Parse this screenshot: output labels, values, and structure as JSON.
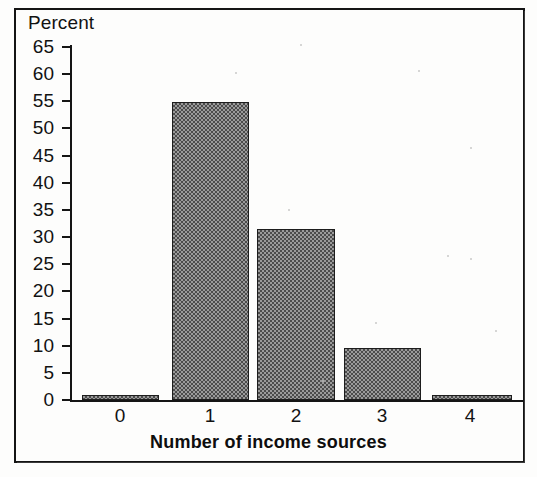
{
  "chart_data": {
    "type": "bar",
    "title": "",
    "xlabel": "Number of income sources",
    "ylabel": "Percent",
    "categories": [
      "0",
      "1",
      "2",
      "3",
      "4"
    ],
    "values": [
      1,
      54.9,
      31.4,
      9.6,
      0.7
    ],
    "ylim": [
      0,
      65
    ],
    "ytick_labels": [
      "0",
      "5",
      "10",
      "15",
      "20",
      "25",
      "30",
      "35",
      "40",
      "45",
      "50",
      "55",
      "60",
      "65"
    ],
    "ytick_values": [
      0,
      5,
      10,
      15,
      20,
      25,
      30,
      35,
      40,
      45,
      50,
      55,
      60,
      65
    ],
    "grid": false,
    "legend": false,
    "bar_fill": "#7d7d7d",
    "bar_edge": "#1d1d1d",
    "axis_color": "#151515",
    "background": "#fdfdfc"
  }
}
